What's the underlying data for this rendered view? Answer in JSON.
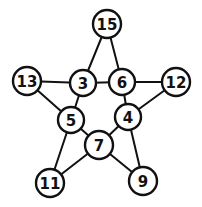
{
  "diagram": {
    "type": "pentagram-number-graph",
    "colors": {
      "stroke": "#111111",
      "fill": "#ffffff",
      "text": "#111111"
    },
    "nodes": [
      {
        "id": "n15",
        "label": "15",
        "x": 107,
        "y": 24,
        "r": 14
      },
      {
        "id": "n13",
        "label": "13",
        "x": 27,
        "y": 81,
        "r": 14
      },
      {
        "id": "n3",
        "label": "3",
        "x": 83,
        "y": 83,
        "r": 13
      },
      {
        "id": "n6",
        "label": "6",
        "x": 122,
        "y": 82,
        "r": 13
      },
      {
        "id": "n12",
        "label": "12",
        "x": 176,
        "y": 82,
        "r": 14
      },
      {
        "id": "n5",
        "label": "5",
        "x": 71,
        "y": 120,
        "r": 13
      },
      {
        "id": "n4",
        "label": "4",
        "x": 128,
        "y": 117,
        "r": 13
      },
      {
        "id": "n7",
        "label": "7",
        "x": 99,
        "y": 145,
        "r": 14
      },
      {
        "id": "n11",
        "label": "11",
        "x": 50,
        "y": 183,
        "r": 14
      },
      {
        "id": "n9",
        "label": "9",
        "x": 143,
        "y": 181,
        "r": 14
      }
    ],
    "edges": [
      [
        "n15",
        "n3"
      ],
      [
        "n15",
        "n6"
      ],
      [
        "n13",
        "n3"
      ],
      [
        "n13",
        "n5"
      ],
      [
        "n3",
        "n6"
      ],
      [
        "n3",
        "n5"
      ],
      [
        "n6",
        "n12"
      ],
      [
        "n6",
        "n4"
      ],
      [
        "n12",
        "n4"
      ],
      [
        "n5",
        "n7"
      ],
      [
        "n5",
        "n11"
      ],
      [
        "n4",
        "n7"
      ],
      [
        "n4",
        "n9"
      ],
      [
        "n7",
        "n11"
      ],
      [
        "n7",
        "n9"
      ]
    ]
  }
}
